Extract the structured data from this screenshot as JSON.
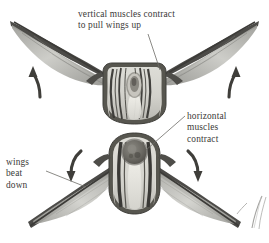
{
  "figure": {
    "kind": "insect-flight-muscle-diagram",
    "background_color": "#ffffff",
    "ink_color": "#3b3a38",
    "panels": [
      {
        "name": "upstroke-panel",
        "position": "top",
        "description": "insect thorax with wings raised, vertical muscles contracted"
      },
      {
        "name": "downstroke-panel",
        "position": "bottom",
        "description": "insect thorax with wings lowered, horizontal muscles contracted"
      }
    ]
  },
  "labels": {
    "vertical": {
      "text": "vertical muscles contract\nto pull wings up",
      "line1": "vertical muscles contract",
      "line2": "to pull wings up"
    },
    "horizontal": {
      "text": "horizontal\nmuscles\ncontract",
      "line1": "horizontal",
      "line2": "muscles",
      "line3": "contract"
    },
    "wings": {
      "text": "wings\nbeat\ndown",
      "line1": "wings",
      "line2": "beat",
      "line3": "down"
    }
  },
  "arrows": [
    {
      "name": "upstroke-arrow-left",
      "direction": "up",
      "panel": "upstroke-panel"
    },
    {
      "name": "upstroke-arrow-right",
      "direction": "up",
      "panel": "upstroke-panel"
    },
    {
      "name": "downstroke-arrow-left",
      "direction": "down",
      "panel": "downstroke-panel"
    },
    {
      "name": "downstroke-arrow-right",
      "direction": "down",
      "panel": "downstroke-panel"
    }
  ],
  "colors": {
    "ink": "#3b3a38",
    "wing_dark": "#4a4a48",
    "wing_membrane": "#b9b9b5",
    "thorax_outline": "#575653",
    "thorax_fill": "#d9d8d2",
    "muscle_dark": "#3c3b38",
    "muscle_light": "#e6e5df",
    "spiracle": "#6e6c66"
  }
}
